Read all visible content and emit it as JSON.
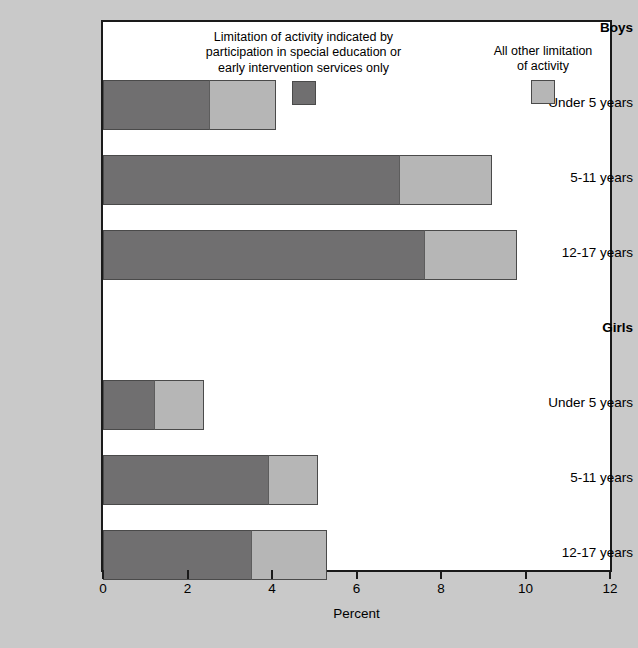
{
  "chart_data": {
    "type": "bar",
    "orientation": "horizontal",
    "stacked": true,
    "title": "",
    "xlabel": "Percent",
    "ylabel": "",
    "xlim": [
      0,
      12
    ],
    "xticks": [
      0,
      2,
      4,
      6,
      8,
      10,
      12
    ],
    "xtick_labels": [
      "0",
      "2",
      "4",
      "6",
      "8",
      "10",
      "12"
    ],
    "grid": false,
    "legend_position": "top",
    "groups": [
      {
        "name": "Boys"
      },
      {
        "name": "Girls"
      }
    ],
    "categories": [
      "Under 5 years",
      "5-11 years",
      "12-17 years",
      "Under 5 years",
      "5-11 years",
      "12-17 years"
    ],
    "series": [
      {
        "name": "Limitation of activity indicated by participation in special education or early intervention services only",
        "short_name": "special-education-only",
        "color": "#706f70",
        "values": [
          2.5,
          7.0,
          7.6,
          1.2,
          3.9,
          3.5
        ]
      },
      {
        "name": "All other limitation of activity",
        "short_name": "all-other-limitation",
        "color": "#b6b6b6",
        "values": [
          1.6,
          2.2,
          2.2,
          1.2,
          1.2,
          1.8
        ]
      }
    ],
    "totals": [
      4.1,
      9.2,
      9.8,
      2.4,
      5.1,
      5.3
    ]
  },
  "legend": {
    "entries": [
      {
        "label": "Limitation of activity indicated by\nparticipation in special education or\nearly intervention services only",
        "swatch_color": "#706f70"
      },
      {
        "label": "All other limitation\nof activity",
        "swatch_color": "#b6b6b6"
      }
    ]
  },
  "axis": {
    "x_title": "Percent",
    "tick_labels": [
      "0",
      "2",
      "4",
      "6",
      "8",
      "10",
      "12"
    ]
  },
  "rows": [
    {
      "label": "Boys",
      "type": "group",
      "dark": 0,
      "light": 0
    },
    {
      "label": "Under 5 years",
      "type": "category",
      "dark": 2.5,
      "light": 1.6
    },
    {
      "label": "5-11 years",
      "type": "category",
      "dark": 7.0,
      "light": 2.2
    },
    {
      "label": "12-17 years",
      "type": "category",
      "dark": 7.6,
      "light": 2.2
    },
    {
      "label": "Girls",
      "type": "group",
      "dark": 0,
      "light": 0
    },
    {
      "label": "Under 5 years",
      "type": "category",
      "dark": 1.2,
      "light": 1.2
    },
    {
      "label": "5-11 years",
      "type": "category",
      "dark": 3.9,
      "light": 1.2
    },
    {
      "label": "12-17 years",
      "type": "category",
      "dark": 3.5,
      "light": 1.8
    }
  ],
  "colors": {
    "background": "#c9c9c9",
    "plot_background": "#ffffff",
    "axis": "#1a1a1a",
    "series_dark": "#706f70",
    "series_light": "#b6b6b6"
  }
}
